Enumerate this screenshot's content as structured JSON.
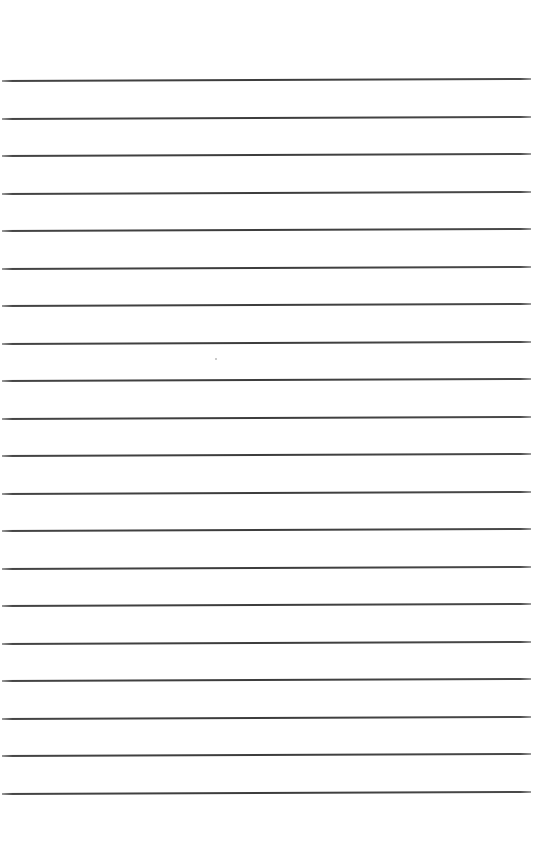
{
  "page": {
    "type": "lined-paper",
    "background_color": "#ffffff",
    "rule_color": "#3c3c3c",
    "rule_count": 20,
    "first_rule_y": 80,
    "rule_spacing": 37.5,
    "rules_left_x": 2,
    "rules_right_x": 531
  },
  "marks": [
    {
      "x": 215,
      "y": 358
    }
  ]
}
